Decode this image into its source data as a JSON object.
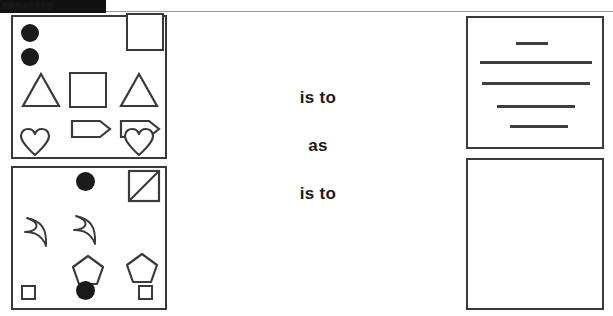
{
  "header": {
    "redaction_label": "REDACTED",
    "rule_color": "#9a9a9a",
    "bar_color": "#111111"
  },
  "analogy": {
    "first": "is to",
    "middle": "as",
    "second": "is to"
  },
  "colors": {
    "stroke": "#3a3a3a",
    "fill": "#1a1a1a",
    "background": "#ffffff"
  },
  "panels": {
    "a": {
      "name": "top-left-shape-panel",
      "shapes": [
        {
          "kind": "filled-circle",
          "label": "circle",
          "x": 8,
          "y": 7,
          "size": 18
        },
        {
          "kind": "filled-circle",
          "label": "circle",
          "x": 8,
          "y": 31,
          "size": 18
        },
        {
          "kind": "outlined-square",
          "label": "square",
          "x": 113,
          "y": -4,
          "size": 38
        },
        {
          "kind": "triangle",
          "label": "triangle",
          "x": 8,
          "y": 55,
          "size": 36
        },
        {
          "kind": "outlined-square",
          "label": "square",
          "x": 56,
          "y": 55,
          "size": 36
        },
        {
          "kind": "triangle",
          "label": "triangle",
          "x": 108,
          "y": 55,
          "size": 36
        },
        {
          "kind": "arrow-banner",
          "label": "arrow",
          "x": 57,
          "y": 99,
          "size": 36
        },
        {
          "kind": "arrow-banner",
          "label": "arrow",
          "x": 107,
          "y": 99,
          "size": 36
        },
        {
          "kind": "heart",
          "label": "heart",
          "x": 7,
          "y": 112,
          "size": 30
        },
        {
          "kind": "heart",
          "label": "heart",
          "x": 110,
          "y": 112,
          "size": 30
        }
      ]
    },
    "b": {
      "name": "bottom-left-shape-panel",
      "shapes": [
        {
          "kind": "filled-circle",
          "label": "circle",
          "x": 63,
          "y": 4,
          "size": 19
        },
        {
          "kind": "slashed-square",
          "label": "square-with-diagonal",
          "x": 114,
          "y": 2,
          "size": 32
        },
        {
          "kind": "crescent",
          "label": "crescent-moon",
          "x": 8,
          "y": 48,
          "size": 32
        },
        {
          "kind": "crescent",
          "label": "crescent-moon",
          "x": 57,
          "y": 46,
          "size": 32
        },
        {
          "kind": "pentagon",
          "label": "pentagon",
          "x": 58,
          "y": 87,
          "size": 32
        },
        {
          "kind": "pentagon",
          "label": "pentagon",
          "x": 112,
          "y": 85,
          "size": 32
        },
        {
          "kind": "small-square",
          "label": "small-square",
          "x": 8,
          "y": 117,
          "size": 14
        },
        {
          "kind": "filled-circle",
          "label": "circle",
          "x": 63,
          "y": 114,
          "size": 19
        },
        {
          "kind": "small-square",
          "label": "small-square",
          "x": 124,
          "y": 117,
          "size": 14
        }
      ]
    },
    "c": {
      "name": "top-right-lines-panel",
      "lines": [
        {
          "label": "line-1",
          "x": 48,
          "y": 24,
          "length": 32
        },
        {
          "label": "line-2",
          "x": 12,
          "y": 43,
          "length": 112
        },
        {
          "label": "line-3",
          "x": 14,
          "y": 64,
          "length": 108
        },
        {
          "label": "line-4",
          "x": 29,
          "y": 87,
          "length": 78
        },
        {
          "label": "line-5",
          "x": 42,
          "y": 107,
          "length": 58
        }
      ]
    },
    "d": {
      "name": "bottom-right-answer-panel",
      "content": "",
      "empty": true
    }
  }
}
